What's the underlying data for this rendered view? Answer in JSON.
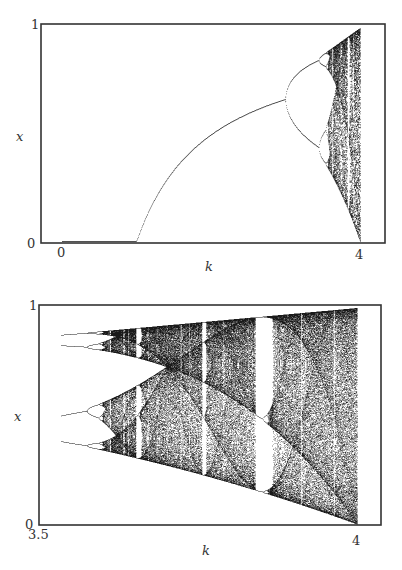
{
  "chart_data": [
    {
      "type": "scatter",
      "title": "",
      "description": "Bifurcation diagram of the logistic map x -> k x (1 - x), full range",
      "xlabel": "k",
      "ylabel": "x",
      "xlim": [
        0,
        4
      ],
      "ylim": [
        0,
        1
      ],
      "x_ticks": [
        "0",
        "4"
      ],
      "y_ticks": [
        "0",
        "1"
      ],
      "grid": false,
      "legend": null,
      "features": {
        "fixed_point_branch": "x = 1 - 1/k for 1 < k < 3",
        "first_bifurcation_k": 3.0,
        "second_bifurcation_k": 3.449,
        "onset_of_chaos_k": 3.57,
        "periodic_windows_k": [
          3.63,
          3.74,
          3.83
        ]
      }
    },
    {
      "type": "scatter",
      "title": "",
      "description": "Bifurcation diagram of the logistic map, magnified range",
      "xlabel": "k",
      "ylabel": "x",
      "xlim": [
        3.5,
        4
      ],
      "ylim": [
        0,
        1
      ],
      "x_ticks": [
        "3.5",
        "4"
      ],
      "y_ticks": [
        "0",
        "1"
      ],
      "grid": false,
      "legend": null,
      "features": {
        "period_4_start_k": 3.5,
        "onset_of_chaos_k": 3.57,
        "period_6_window_k": 3.63,
        "period_5_window_k": 3.74,
        "period_3_window_k": [
          3.828,
          3.857
        ],
        "full_chaos_k": 4.0
      }
    }
  ],
  "top": {
    "y_tick_top": "1",
    "y_tick_bottom": "0",
    "x_tick_left": "0",
    "x_tick_right": "4",
    "xlabel": "k",
    "ylabel": "x",
    "k_min": 0,
    "k_max": 4,
    "frame": {
      "x": 41,
      "y": 24,
      "w": 344,
      "h": 219
    },
    "plot": {
      "x0": 62,
      "x1": 360,
      "ytop": 28,
      "ybot": 241
    }
  },
  "bottom": {
    "y_tick_top": "1",
    "y_tick_bottom": "0",
    "x_tick_left": "3.5",
    "x_tick_right": "4",
    "xlabel": "k",
    "ylabel": "x",
    "k_min": 3.5,
    "k_max": 4.0,
    "frame": {
      "x": 39,
      "y": 305,
      "w": 342,
      "h": 220
    },
    "plot": {
      "x0": 61,
      "x1": 357,
      "ytop": 308,
      "ybot": 524
    }
  },
  "colors": {
    "ink": "#1a1a1a",
    "frame": "#333333",
    "background": "#ffffff"
  }
}
